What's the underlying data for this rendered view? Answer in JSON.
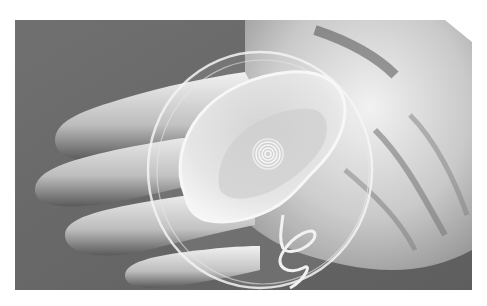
{
  "image": {
    "alt": "Grayscale photograph of a gloved hand holding a clear petri dish containing a 3D-printed bionic ear with a spiral coil antenna and a curly wire lead",
    "subjects": [
      "gloved-hand",
      "petri-dish",
      "bionic-ear",
      "spiral-coil",
      "curly-wire"
    ],
    "palette": {
      "background": "#6b6b6b",
      "glove": "#d9d9d9",
      "glove_shadow": "#8a8a8a",
      "ear": "#e2e2e2",
      "page": "#ffffff"
    }
  }
}
